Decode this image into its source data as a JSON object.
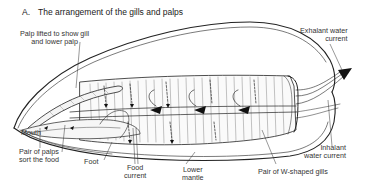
{
  "figure": {
    "panel_letter": "A.",
    "title": "The arrangement of the gills and palps"
  },
  "labels": {
    "palp_lifted_line1": "Palp lifted to show gill",
    "palp_lifted_line2": "and lower palp",
    "exhalant_line1": "Exhalant water",
    "exhalant_line2": "current",
    "mouth": "Mouth",
    "palps_line1": "Pair of palps",
    "palps_line2": "sort the food",
    "foot": "Foot",
    "food_line1": "Food",
    "food_line2": "current",
    "mantle_line1": "Lower",
    "mantle_line2": "mantle",
    "gills": "Pair of W-shaped gills",
    "inhalant_line1": "Inhalant",
    "inhalant_line2": "water current"
  },
  "colors": {
    "ink": "#222222",
    "background": "#ffffff"
  }
}
